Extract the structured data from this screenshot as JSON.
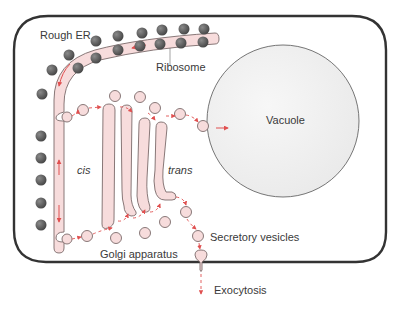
{
  "labels": {
    "rough_er": "Rough ER",
    "ribosome": "Ribosome",
    "vacuole": "Vacuole",
    "cis": "cis",
    "trans": "trans",
    "golgi": "Golgi apparatus",
    "secretory": "Secretory vesicles",
    "exocytosis": "Exocytosis"
  },
  "colors": {
    "membrane_fill": "#f7dcdc",
    "membrane_stroke": "#7a6a6a",
    "ribosome": "#5a5a5a",
    "arrow": "#e05050",
    "cell_border": "#333333",
    "vacuole_fill": "#f1f1f1"
  }
}
